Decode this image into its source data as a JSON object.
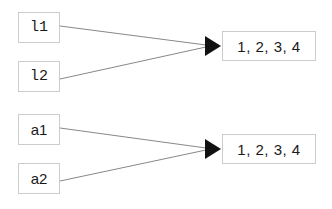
{
  "diagram": {
    "type": "directed-graph",
    "background_color": "#ffffff",
    "node_fill_color": "#ffffff",
    "node_border_color": "#cccccc",
    "edge_color": "#888888",
    "arrowhead_color": "#111111",
    "text_color": "#1a1a1a",
    "groups": [
      {
        "id": "group-upper",
        "sources": [
          {
            "id": "l1",
            "label": "l1",
            "x": 18,
            "y": 12,
            "w": 42,
            "h": 31,
            "font": "mono"
          },
          {
            "id": "l2",
            "label": "l2",
            "x": 18,
            "y": 61,
            "w": 42,
            "h": 31,
            "font": "mono"
          }
        ],
        "target": {
          "id": "t1",
          "label": "1, 2, 3, 4",
          "x": 222,
          "y": 31,
          "w": 94,
          "h": 30
        },
        "edges": [
          {
            "from": "l1",
            "to": "t1"
          },
          {
            "from": "l2",
            "to": "t1"
          }
        ]
      },
      {
        "id": "group-lower",
        "sources": [
          {
            "id": "a1",
            "label": "a1",
            "x": 18,
            "y": 114,
            "w": 42,
            "h": 31,
            "font": "sans"
          },
          {
            "id": "a2",
            "label": "a2",
            "x": 18,
            "y": 163,
            "w": 42,
            "h": 31,
            "font": "sans"
          }
        ],
        "target": {
          "id": "t2",
          "label": "1, 2, 3, 4",
          "x": 222,
          "y": 134,
          "w": 94,
          "h": 30
        },
        "edges": [
          {
            "from": "a1",
            "to": "t2"
          },
          {
            "from": "a2",
            "to": "t2"
          }
        ]
      }
    ]
  }
}
